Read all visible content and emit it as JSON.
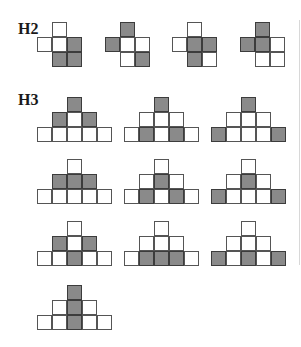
{
  "labels": {
    "h2": "H2",
    "h3": "H3"
  },
  "colors": {
    "filled": "#8a8a8a",
    "empty": "#ffffff",
    "border": "#555555"
  },
  "cell_size": 15,
  "h2": {
    "shape": "plus-with-corner",
    "description": "Cells: top(col1), row2(col0,col1,col2), row3(col1,col2)",
    "figures": [
      {
        "x": 37,
        "y": 22,
        "top": [
          0
        ],
        "mid": [
          0,
          0,
          1
        ],
        "bot": [
          1,
          1
        ]
      },
      {
        "x": 105,
        "y": 22,
        "top": [
          1
        ],
        "mid": [
          1,
          0,
          0
        ],
        "bot": [
          0,
          1
        ]
      },
      {
        "x": 172,
        "y": 22,
        "top": [
          0
        ],
        "mid": [
          0,
          1,
          1
        ],
        "bot": [
          1,
          0
        ]
      },
      {
        "x": 240,
        "y": 22,
        "top": [
          1
        ],
        "mid": [
          1,
          1,
          0
        ],
        "bot": [
          0,
          0
        ]
      }
    ]
  },
  "h3": {
    "shape": "pyramid-1-3-5",
    "figures": [
      {
        "x": 37,
        "y": 97,
        "top": [
          1
        ],
        "mid": [
          1,
          0,
          1
        ],
        "bot": [
          0,
          0,
          0,
          0,
          0
        ]
      },
      {
        "x": 124,
        "y": 97,
        "top": [
          1
        ],
        "mid": [
          0,
          0,
          0
        ],
        "bot": [
          0,
          1,
          0,
          1,
          0
        ]
      },
      {
        "x": 211,
        "y": 97,
        "top": [
          1
        ],
        "mid": [
          0,
          0,
          0
        ],
        "bot": [
          1,
          0,
          0,
          0,
          1
        ]
      },
      {
        "x": 37,
        "y": 159,
        "top": [
          0
        ],
        "mid": [
          1,
          1,
          1
        ],
        "bot": [
          0,
          0,
          0,
          0,
          0
        ]
      },
      {
        "x": 124,
        "y": 159,
        "top": [
          0
        ],
        "mid": [
          0,
          1,
          0
        ],
        "bot": [
          0,
          1,
          0,
          1,
          0
        ]
      },
      {
        "x": 211,
        "y": 159,
        "top": [
          0
        ],
        "mid": [
          0,
          1,
          0
        ],
        "bot": [
          1,
          0,
          0,
          0,
          1
        ]
      },
      {
        "x": 37,
        "y": 221,
        "top": [
          0
        ],
        "mid": [
          1,
          0,
          1
        ],
        "bot": [
          0,
          0,
          1,
          0,
          0
        ]
      },
      {
        "x": 124,
        "y": 221,
        "top": [
          0
        ],
        "mid": [
          0,
          0,
          0
        ],
        "bot": [
          0,
          1,
          1,
          1,
          0
        ]
      },
      {
        "x": 211,
        "y": 221,
        "top": [
          0
        ],
        "mid": [
          0,
          0,
          0
        ],
        "bot": [
          1,
          0,
          1,
          0,
          1
        ]
      },
      {
        "x": 37,
        "y": 285,
        "top": [
          1
        ],
        "mid": [
          0,
          1,
          0
        ],
        "bot": [
          0,
          0,
          1,
          0,
          0
        ]
      }
    ]
  }
}
